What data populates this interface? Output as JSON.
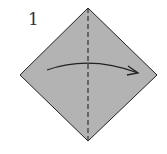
{
  "diagram": {
    "step_number": "1",
    "paper_color": "#b3b3b3",
    "edge_color": "#222222",
    "fold_line": "valley-fold-vertical-diagonal",
    "arrow_direction": "left-to-right"
  }
}
